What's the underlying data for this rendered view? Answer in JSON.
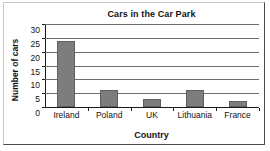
{
  "chart_data": {
    "type": "bar",
    "title": "Cars in the Car Park",
    "xlabel": "Country",
    "ylabel": "Number of cars",
    "categories": [
      "Ireland",
      "Poland",
      "UK",
      "Lithuania",
      "France"
    ],
    "values": [
      24,
      6,
      3,
      6,
      2
    ],
    "ylim": [
      0,
      30
    ],
    "ytick_labels": [
      "0",
      "5",
      "10",
      "15",
      "20",
      "25",
      "30"
    ],
    "ytick_values": [
      0,
      5,
      10,
      15,
      20,
      25,
      30
    ],
    "grid": true,
    "legend": "none",
    "bar_color": "#7d7d7d",
    "bar_edge_color": "#5e5e5e",
    "axis_color": "#1a1a1a",
    "gridline_color": "#6e6e6e",
    "background_color": "#ffffff"
  }
}
